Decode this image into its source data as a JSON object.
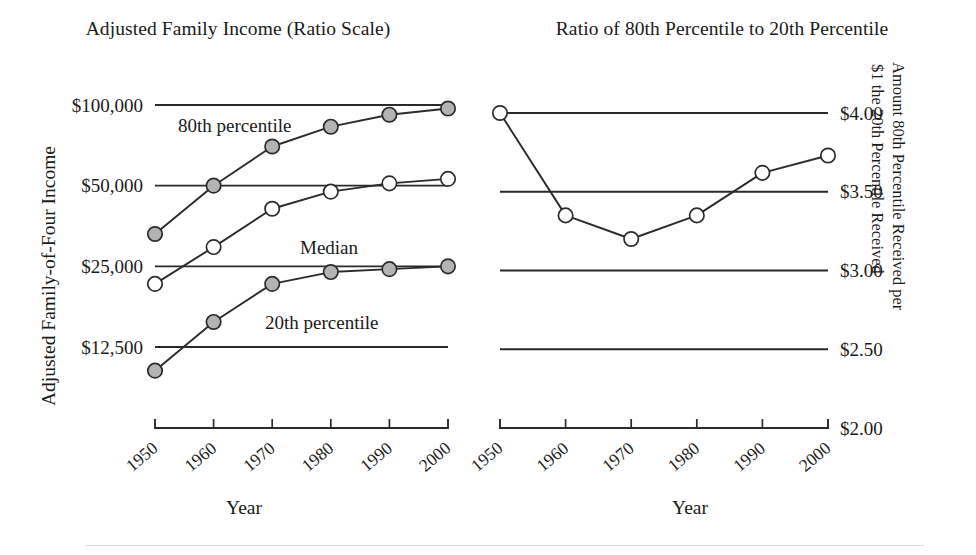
{
  "figure": {
    "background": "#ffffff",
    "ink_color": "#2b2b2b",
    "marker_fill_gray": "#b3b3b3",
    "marker_fill_open": "#ffffff"
  },
  "chart_data": [
    {
      "id": "left",
      "type": "line",
      "title": "Adjusted Family Income (Ratio Scale)",
      "xlabel": "Year",
      "ylabel": "Adjusted Family-of-Four Income",
      "scale": "log",
      "grid": true,
      "legend": "inline-annotations",
      "categories": [
        1950,
        1960,
        1970,
        1980,
        1990,
        2000
      ],
      "xticklabels": [
        "1950",
        "1960",
        "1970",
        "1980",
        "1990",
        "2000"
      ],
      "yticklabels": [
        "$100,000",
        "$50,000",
        "$25,000",
        "$12,500"
      ],
      "ytickvalues": [
        100000,
        50000,
        25000,
        12500
      ],
      "ylim": [
        9000,
        115000
      ],
      "series": [
        {
          "name": "80th percentile",
          "marker": "filled",
          "annotation": "80th percentile",
          "values": [
            33000,
            50000,
            70000,
            83000,
            92000,
            97000
          ]
        },
        {
          "name": "Median",
          "marker": "open",
          "annotation": "Median",
          "values": [
            21500,
            29500,
            41000,
            47500,
            51000,
            53000
          ]
        },
        {
          "name": "20th percentile",
          "marker": "filled",
          "annotation": "20th percentile",
          "values": [
            10200,
            15500,
            21500,
            23800,
            24400,
            25000
          ]
        }
      ]
    },
    {
      "id": "right",
      "type": "line",
      "title": "Ratio of 80th Percentile to 20th Percentile",
      "xlabel": "Year",
      "ylabel_line1": "Amount 80th Percentile Received per",
      "ylabel_line2": "$1 the 20th Percentile Received",
      "scale": "linear",
      "grid": true,
      "categories": [
        1950,
        1960,
        1970,
        1980,
        1990,
        2000
      ],
      "xticklabels": [
        "1950",
        "1960",
        "1970",
        "1980",
        "1990",
        "2000"
      ],
      "yticklabels": [
        "$4.00",
        "$3.50",
        "$3.00",
        "$2.50",
        "$2.00"
      ],
      "ytickvalues": [
        4.0,
        3.5,
        3.0,
        2.5,
        2.0
      ],
      "ylim": [
        2.0,
        4.0
      ],
      "series": [
        {
          "name": "Ratio of 80th to 20th percentile",
          "marker": "open",
          "values": [
            4.0,
            3.35,
            3.2,
            3.35,
            3.62,
            3.73
          ]
        }
      ]
    }
  ]
}
